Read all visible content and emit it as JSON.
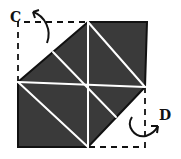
{
  "diagram": {
    "type": "origami-fold-step",
    "labels": {
      "corner_c": "C",
      "corner_d": "D"
    },
    "colors": {
      "paper_fill": "#3a3a3a",
      "crease": "#ffffff",
      "outline": "#111111",
      "dashed": "#111111",
      "background": "#ffffff"
    },
    "arrows": [
      {
        "name": "fold-arrow-c",
        "target": "C",
        "direction": "fold-behind-top-left"
      },
      {
        "name": "fold-arrow-d",
        "target": "D",
        "direction": "fold-behind-bottom-right"
      }
    ]
  }
}
